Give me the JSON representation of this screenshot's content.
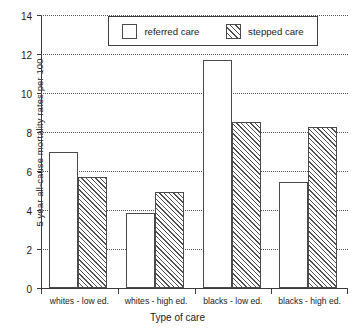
{
  "chart_data": {
    "type": "bar",
    "title": "",
    "xlabel": "Type of care",
    "ylabel": "5 year all-cause mortality rates per 100",
    "categories": [
      "whites - low ed.",
      "whites - high ed.",
      "blacks - low ed.",
      "blacks - high ed."
    ],
    "series": [
      {
        "name": "referred care",
        "values": [
          7.0,
          3.85,
          11.7,
          5.45
        ],
        "fill": "white",
        "pattern": "solid"
      },
      {
        "name": "stepped care",
        "values": [
          5.7,
          4.9,
          8.5,
          8.25
        ],
        "fill": "white",
        "pattern": "diagonal-hatch"
      }
    ],
    "ylim": [
      0,
      14
    ],
    "yticks": [
      0,
      2,
      4,
      6,
      8,
      10,
      12,
      14
    ],
    "ytick_labels": [
      "0",
      "2",
      "4",
      "6",
      "8",
      "10",
      "12",
      "14"
    ],
    "grid": "horizontal-dotted",
    "legend_position": "top-center",
    "axis_color": "#3b3b3b",
    "bar_edge_color": "#4a4a4a",
    "grid_color": "#555555",
    "background": "#ffffff"
  }
}
